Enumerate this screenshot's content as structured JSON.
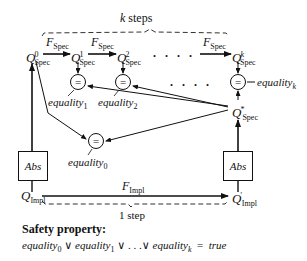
{
  "top_brace_label": "k steps",
  "bottom_brace_label": "1 step",
  "spec_states": [
    {
      "base": "Q",
      "sup": "0",
      "sub": "Spec"
    },
    {
      "base": "Q",
      "sup": "1",
      "sub": "Spec"
    },
    {
      "base": "Q",
      "sup": "2",
      "sub": "Spec"
    },
    {
      "base": "Q",
      "sup": "k",
      "sub": "Spec"
    }
  ],
  "spec_transition": {
    "base": "F",
    "sub": "Spec"
  },
  "star_state": {
    "base": "Q",
    "sup": "*",
    "sub": "Spec"
  },
  "impl_states": [
    {
      "base": "Q",
      "sub": "Impl"
    },
    {
      "base": "Q",
      "prime": "'",
      "sub": "Impl"
    }
  ],
  "impl_transition": {
    "base": "F",
    "sub": "Impl"
  },
  "abs_label": "Abs",
  "equality_symbol": "=",
  "equalities": [
    {
      "base": "equality",
      "sub": "0"
    },
    {
      "base": "equality",
      "sub": "1"
    },
    {
      "base": "equality",
      "sub": "2"
    },
    {
      "base": "equality",
      "sub": "k"
    }
  ],
  "ellipsis_top": ". . . .",
  "ellipsis_mid": ". . . .",
  "safety": {
    "title": "Safety property:",
    "terms": [
      {
        "base": "equality",
        "sub": "0"
      },
      {
        "base": "equality",
        "sub": "1"
      },
      {
        "base": "equality",
        "sub": "k"
      }
    ],
    "or_symbol": "∨",
    "dots": ". . .",
    "equals": "=",
    "result": "true"
  }
}
